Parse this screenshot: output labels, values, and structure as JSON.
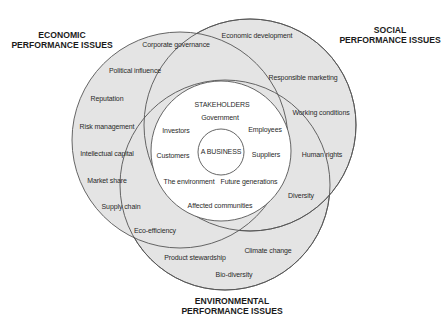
{
  "diagram": {
    "titles": {
      "economic": [
        "ECONOMIC",
        "PERFORMANCE ISSUES"
      ],
      "social": [
        "SOCIAL",
        "PERFORMANCE ISSUES"
      ],
      "environmental": [
        "ENVIRONMENTAL",
        "PERFORMANCE ISSUES"
      ]
    },
    "economic_issues": [
      "Corporate governance",
      "Political influence",
      "Reputation",
      "Risk management",
      "Intellectual capital",
      "Market share",
      "Supply chain",
      "Eco-efficiency"
    ],
    "social_issues": [
      "Economic development",
      "Responsible marketing",
      "Working conditions",
      "Human rights",
      "Diversity"
    ],
    "environmental_issues": [
      "Product stewardship",
      "Climate change",
      "Bio-diversity"
    ],
    "stakeholders": {
      "heading": "STAKEHOLDERS",
      "items": [
        "Government",
        "Investors",
        "Employees",
        "Customers",
        "Suppliers",
        "The environment",
        "Future generations",
        "Affected communities"
      ]
    },
    "core": "A BUSINESS",
    "colors": {
      "ring_fill": "#e4e4e4",
      "stroke": "#555555",
      "inner_fill": "#ffffff"
    }
  }
}
